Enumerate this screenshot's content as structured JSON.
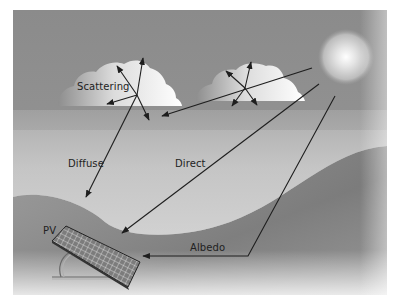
{
  "diagram": {
    "labels": {
      "scattering": "Scattering",
      "diffuse": "Diffuse",
      "direct": "Direct",
      "albedo": "Albedo",
      "pv": "PV"
    },
    "elements": [
      "sun",
      "cloud-left",
      "cloud-right",
      "hill-background",
      "ground",
      "pv-panel",
      "panel-stand"
    ],
    "arrows": [
      {
        "name": "sun-to-cloud-left",
        "from": "sun",
        "to": "cloud-left"
      },
      {
        "name": "diffuse",
        "from": "cloud-left",
        "to": "ground"
      },
      {
        "name": "direct",
        "from": "sun",
        "to": "pv-panel"
      },
      {
        "name": "albedo",
        "from": "sun",
        "via": "ground",
        "to": "pv-panel"
      }
    ],
    "colors": {
      "sky": "#8f8f8f",
      "hill": "#7a7a7a",
      "ground_light": "#d4d4d4",
      "sun_core": "#ffffff",
      "line": "#1e1e1e"
    }
  }
}
